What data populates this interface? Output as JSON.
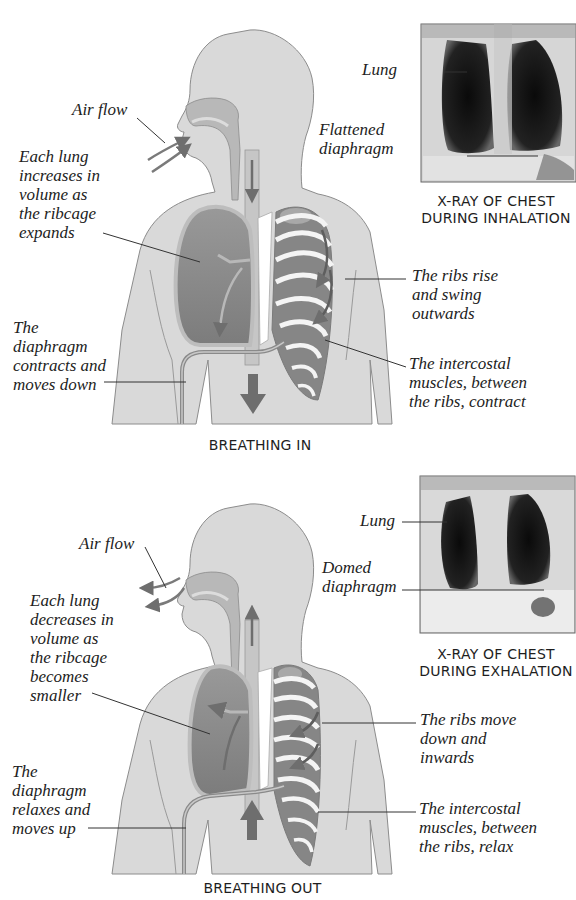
{
  "top_cut_text": "... respiration, the diaphragm and intercostal muscles ...",
  "panels": {
    "inhale": {
      "caption": "BREATHING IN",
      "labels": {
        "air_flow": "Air flow",
        "lung_volume": "Each lung\nincreases in\nvolume as\nthe ribcage\nexpands",
        "diaphragm": "The\ndiaphragm\ncontracts and\nmoves down",
        "ribs": "The ribs rise\nand swing\noutwards",
        "intercostal": "The intercostal\nmuscles, between\nthe ribs, contract"
      },
      "xray": {
        "caption": "X-RAY OF CHEST\nDURING INHALATION",
        "lung_label": "Lung",
        "diaphragm_label": "Flattened\ndiaphragm"
      },
      "arrow_direction": "down"
    },
    "exhale": {
      "caption": "BREATHING OUT",
      "labels": {
        "air_flow": "Air flow",
        "lung_volume": "Each lung\ndecreases in\nvolume as\nthe ribcage\nbecomes\nsmaller",
        "diaphragm": "The\ndiaphragm\nrelaxes and\nmoves up",
        "ribs": "The ribs move\ndown and\ninwards",
        "intercostal": "The intercostal\nmuscles, between\nthe ribs, relax"
      },
      "xray": {
        "caption": "X-RAY OF CHEST\nDURING EXHALATION",
        "lung_label": "Lung",
        "diaphragm_label": "Domed\ndiaphragm"
      },
      "arrow_direction": "up"
    }
  },
  "colors": {
    "body_fill": "#d9d9d9",
    "body_stroke": "#8c8c8c",
    "airway": "#b8b8b8",
    "lung": "#8a8a8a",
    "muscle": "#7e7e7e",
    "rib": "#f4f4f4",
    "arrow": "#6e6e6e",
    "leader": "#333333"
  }
}
